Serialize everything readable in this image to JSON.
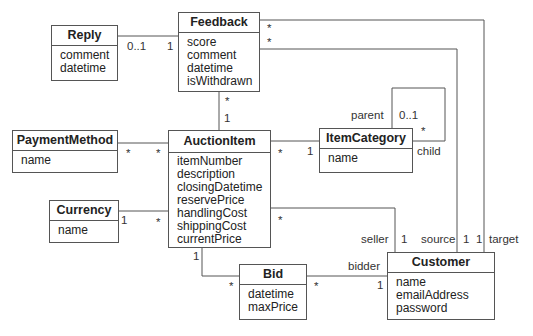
{
  "classes": {
    "reply": {
      "name": "Reply",
      "attributes": [
        "comment",
        "datetime"
      ]
    },
    "feedback": {
      "name": "Feedback",
      "attributes": [
        "score",
        "comment",
        "datetime",
        "isWithdrawn"
      ]
    },
    "payment_method": {
      "name": "PaymentMethod",
      "attributes": [
        "name"
      ]
    },
    "auction_item": {
      "name": "AuctionItem",
      "attributes": [
        "itemNumber",
        "description",
        "closingDatetime",
        "reservePrice",
        "handlingCost",
        "shippingCost",
        "currentPrice"
      ]
    },
    "currency": {
      "name": "Currency",
      "attributes": [
        "name"
      ]
    },
    "item_category": {
      "name": "ItemCategory",
      "attributes": [
        "name"
      ]
    },
    "bid": {
      "name": "Bid",
      "attributes": [
        "datetime",
        "maxPrice"
      ]
    },
    "customer": {
      "name": "Customer",
      "attributes": [
        "name",
        "emailAddress",
        "password"
      ]
    }
  },
  "labels": {
    "reply_mult": "0..1",
    "feedback_reply_mult": "1",
    "feedback_target_mult": "*",
    "feedback_source_mult": "*",
    "feedback_auction_mult": "*",
    "auction_feedback_mult": "1",
    "payment_mult": "*",
    "auction_payment_mult": "*",
    "auction_category_mult": "*",
    "category_auction_mult": "1",
    "parent_role": "parent",
    "parent_mult": "0..1",
    "child_mult": "*",
    "child_role": "child",
    "currency_mult": "1",
    "auction_currency_mult": "*",
    "auction_seller_mult": "*",
    "seller_role": "seller",
    "seller_mult": "1",
    "source_role": "source",
    "source_mult": "1",
    "target_mult": "1",
    "target_role": "target",
    "auction_bid_mult": "1",
    "bid_auction_mult": "*",
    "bid_customer_mult": "*",
    "bidder_role": "bidder",
    "bidder_mult": "1"
  }
}
